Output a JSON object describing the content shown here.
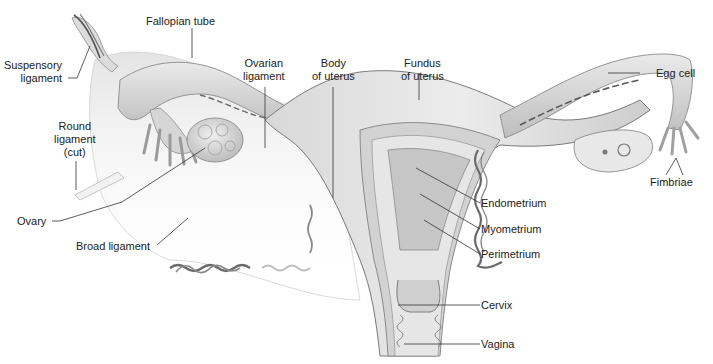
{
  "diagram": {
    "colors": {
      "background": "#ffffff",
      "tissue_light": "#e9e9e9",
      "tissue_mid": "#cfcfcf",
      "tissue_dark": "#9e9e9e",
      "outline": "#7a7a7a",
      "vessel": "#6a6a6a",
      "leader_line": "#333333",
      "text": "#222222"
    },
    "labels": {
      "fallopian_tube": "Fallopian tube",
      "suspensory_ligament": [
        "Suspensory",
        "ligament"
      ],
      "ovarian_ligament": [
        "Ovarian",
        "ligament"
      ],
      "body_of_uterus": [
        "Body",
        "of uterus"
      ],
      "fundus_of_uterus": [
        "Fundus",
        "of uterus"
      ],
      "egg_cell": "Egg cell",
      "round_ligament": [
        "Round",
        "ligament",
        "(cut)"
      ],
      "fimbriae": "Fimbriae",
      "endometrium": "Endometrium",
      "myometrium": "Myometrium",
      "perimetrium": "Perimetrium",
      "ovary": "Ovary",
      "broad_ligament": "Broad ligament",
      "cervix": "Cervix",
      "vagina": "Vagina"
    }
  }
}
